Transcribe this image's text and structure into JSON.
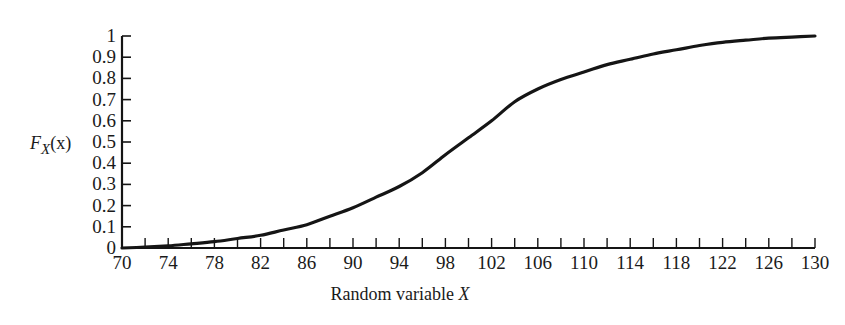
{
  "chart_data": {
    "type": "line",
    "title": "",
    "xlabel": "Random variable X",
    "ylabel": "F_X(x)",
    "xlim": [
      70,
      130
    ],
    "ylim": [
      0,
      1
    ],
    "grid": false,
    "legend": "none",
    "x_ticks_labeled": [
      70,
      74,
      78,
      82,
      86,
      90,
      94,
      98,
      102,
      106,
      110,
      114,
      118,
      122,
      126,
      130
    ],
    "x_tick_step_minor": 2,
    "y_ticks": [
      "0",
      "0.1",
      "0.2",
      "0.3",
      "0.4",
      "0.5",
      "0.6",
      "0.7",
      "0.8",
      "0.9",
      "1"
    ],
    "series": [
      {
        "name": "CDF",
        "x": [
          70,
          72,
          74,
          76,
          78,
          80,
          82,
          84,
          86,
          88,
          90,
          92,
          94,
          96,
          98,
          100,
          102,
          104,
          106,
          108,
          110,
          112,
          114,
          116,
          118,
          120,
          122,
          124,
          126,
          128,
          130
        ],
        "y": [
          0.0,
          0.004,
          0.01,
          0.02,
          0.03,
          0.045,
          0.06,
          0.085,
          0.11,
          0.15,
          0.19,
          0.24,
          0.29,
          0.355,
          0.44,
          0.52,
          0.6,
          0.69,
          0.75,
          0.795,
          0.83,
          0.865,
          0.89,
          0.915,
          0.935,
          0.955,
          0.97,
          0.98,
          0.99,
          0.995,
          1.0
        ]
      }
    ],
    "caption_partial": "(b) ... CDF of X with ... 100 and standard deviation ... 10"
  },
  "labels": {
    "ylabel_main": "F",
    "ylabel_sub": "X",
    "ylabel_arg": "(x)",
    "xlabel_text": "Random variable ",
    "xlabel_var": "X"
  }
}
